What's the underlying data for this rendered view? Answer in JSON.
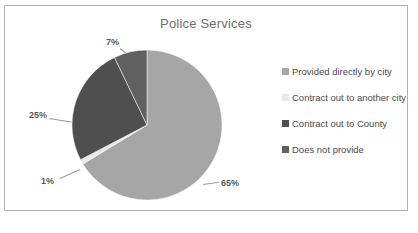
{
  "chart": {
    "title": "Police Services",
    "frame_border_color": "#b2b2b2",
    "background": "#ffffff",
    "title_color": "#6e6e6e"
  },
  "legend": {
    "position": "right",
    "items": [
      {
        "label": "Provided directly by city",
        "color": "#a6a6a6",
        "swatch_name": "legend-swatch-provided-directly-by-city"
      },
      {
        "label": "Contract out to another city",
        "color": "#e8e8e8",
        "swatch_name": "legend-swatch-contract-out-to-another-city"
      },
      {
        "label": "Contract out to County",
        "color": "#4f4f4f",
        "swatch_name": "legend-swatch-contract-out-to-county"
      },
      {
        "label": "Does not provide",
        "color": "#606060",
        "swatch_name": "legend-swatch-does-not-provide"
      }
    ]
  },
  "labels": {
    "pct_65": "65%",
    "pct_1": "1%",
    "pct_25": "25%",
    "pct_7": "7%"
  },
  "chart_data": {
    "type": "pie",
    "title": "Police Services",
    "xlabel": "",
    "ylabel": "",
    "legend_position": "right",
    "grid": false,
    "start_angle_deg": 0,
    "direction": "clockwise",
    "categories": [
      "Provided directly by city",
      "Contract out to another city",
      "Contract out to County",
      "Does not provide"
    ],
    "values": [
      65,
      1,
      25,
      7
    ],
    "data_labels": [
      "65%",
      "1%",
      "25%",
      "7%"
    ],
    "colors": [
      "#a6a6a6",
      "#e8e8e8",
      "#4f4f4f",
      "#606060"
    ],
    "slices": [
      {
        "label": "Provided directly by city",
        "value": 65,
        "display": "65%",
        "color": "#a6a6a6"
      },
      {
        "label": "Contract out to another city",
        "value": 1,
        "display": "1%",
        "color": "#e8e8e8"
      },
      {
        "label": "Contract out to County",
        "value": 25,
        "display": "25%",
        "color": "#4f4f4f"
      },
      {
        "label": "Does not provide",
        "value": 7,
        "display": "7%",
        "color": "#606060"
      }
    ]
  }
}
